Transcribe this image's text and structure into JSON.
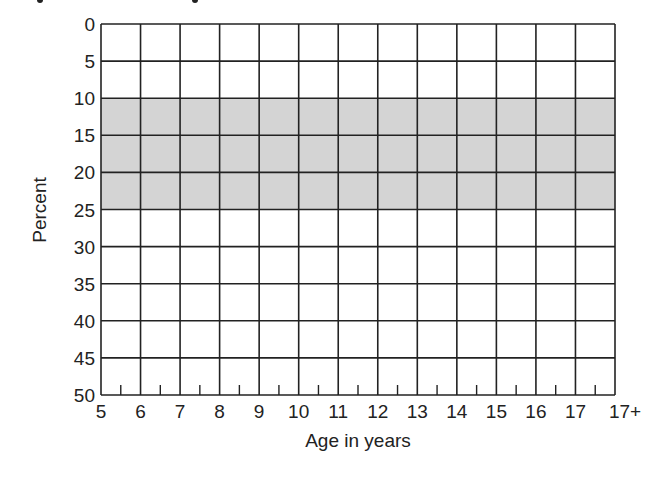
{
  "chart_data": {
    "type": "table",
    "title": "",
    "xlabel": "Age in years",
    "ylabel": "Percent",
    "x_ticks": [
      "5",
      "6",
      "7",
      "8",
      "9",
      "10",
      "11",
      "12",
      "13",
      "14",
      "15",
      "16",
      "17",
      "17+"
    ],
    "y_ticks": [
      "0",
      "5",
      "10",
      "15",
      "20",
      "25",
      "30",
      "35",
      "40",
      "45",
      "50"
    ],
    "ylim": [
      0,
      50
    ],
    "y_inverted": true,
    "grid": true,
    "minor_x_ticks": "half-year ticks along bottom axis",
    "shaded_band": {
      "from": 10,
      "to": 25,
      "color": "#d4d4d4"
    },
    "series": []
  },
  "colors": {
    "grid_line": "#222222",
    "band_fill": "#d4d4d4",
    "background": "#ffffff"
  }
}
